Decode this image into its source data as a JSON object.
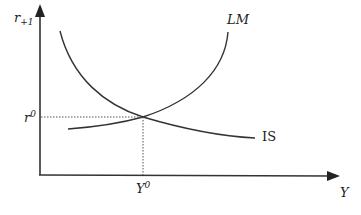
{
  "diagram": {
    "y_axis_label": "r",
    "y_axis_subscript": "+1",
    "x_axis_label": "Y",
    "equilibrium_rate_label": "r",
    "equilibrium_rate_superscript": "0",
    "equilibrium_output_label": "Y",
    "equilibrium_output_superscript": "0",
    "curves": [
      {
        "name": "LM",
        "label": "LM",
        "shape": "upward-sloping"
      },
      {
        "name": "IS",
        "label": "IS",
        "shape": "downward-sloping"
      }
    ],
    "colors": {
      "line": "#333333",
      "dotted": "#555555"
    }
  }
}
